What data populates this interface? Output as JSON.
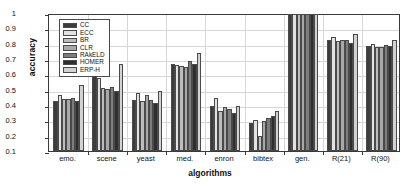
{
  "chart_data": {
    "type": "bar",
    "title": "",
    "xlabel": "algorithms",
    "ylabel": "accuracy",
    "ylim": [
      0.1,
      1.0
    ],
    "yticks": [
      "0.1",
      "0.2",
      "0.3",
      "0.4",
      "0.5",
      "0.6",
      "0.7",
      "0.8",
      "0.9",
      "1"
    ],
    "grid": true,
    "legend_position": "top-left inside axes",
    "categories": [
      "emo.",
      "scene",
      "yeast",
      "med.",
      "enron",
      "bibtex",
      "gen.",
      "R(21)",
      "R(90)"
    ],
    "series": [
      {
        "name": "CC",
        "color": "#3c3c3c",
        "values": [
          0.428,
          0.591,
          0.433,
          0.669,
          0.393,
          0.282,
          0.993,
          0.825,
          0.787
        ]
      },
      {
        "name": "ECC",
        "color": "#e2e2e2",
        "values": [
          0.466,
          0.576,
          0.48,
          0.664,
          0.443,
          0.3,
          0.991,
          0.843,
          0.798
        ]
      },
      {
        "name": "BR",
        "color": "#bdbdbd",
        "values": [
          0.436,
          0.51,
          0.424,
          0.652,
          0.362,
          0.195,
          0.992,
          0.82,
          0.778
        ]
      },
      {
        "name": "CLR",
        "color": "#a8a8a8",
        "values": [
          0.437,
          0.506,
          0.463,
          0.649,
          0.385,
          0.297,
          0.992,
          0.827,
          0.781
        ]
      },
      {
        "name": "RAkELD",
        "color": "#7d7d7d",
        "values": [
          0.443,
          0.519,
          0.43,
          0.686,
          0.373,
          0.315,
          0.991,
          0.822,
          0.791
        ]
      },
      {
        "name": "HOMER",
        "color": "#2f2f2f",
        "values": [
          0.425,
          0.492,
          0.41,
          0.669,
          0.348,
          0.327,
          0.993,
          0.806,
          0.783
        ]
      },
      {
        "name": "ERP-H",
        "color": "#d2d2d2",
        "values": [
          0.53,
          0.665,
          0.494,
          0.742,
          0.395,
          0.364,
          0.995,
          0.864,
          0.824
        ]
      }
    ]
  }
}
